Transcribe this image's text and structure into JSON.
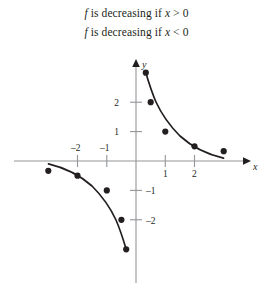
{
  "statements": [
    {
      "id": "statement-1",
      "text": "f is decreasing if x > 0"
    },
    {
      "id": "statement-2",
      "text": "f is decreasing if x < 0"
    }
  ],
  "colors": {
    "ink": "#231f20",
    "axis": "#939598",
    "background": "#ffffff"
  },
  "chart_data": {
    "type": "line",
    "title": "",
    "xlabel": "x",
    "ylabel": "y",
    "xlim": [
      -3.6,
      3.6
    ],
    "ylim": [
      -3.6,
      3.6
    ],
    "grid": false,
    "legend": "none",
    "function": "y = 1/x",
    "x_ticks": [
      -2,
      -1,
      1,
      2
    ],
    "x_tick_labels": [
      "–2",
      "–1",
      "1",
      "2"
    ],
    "y_ticks": [
      2,
      1,
      -1,
      -2
    ],
    "y_tick_labels": [
      "2",
      "1",
      "–1",
      "–2"
    ],
    "series": [
      {
        "name": "branch-positive-x",
        "points": [
          {
            "x": 0.33,
            "y": 3.0
          },
          {
            "x": 0.5,
            "y": 2.0
          },
          {
            "x": 1.0,
            "y": 1.0
          },
          {
            "x": 2.0,
            "y": 0.5
          },
          {
            "x": 3.0,
            "y": 0.33
          }
        ]
      },
      {
        "name": "branch-negative-x",
        "points": [
          {
            "x": -3.0,
            "y": -0.33
          },
          {
            "x": -2.0,
            "y": -0.5
          },
          {
            "x": -1.0,
            "y": -1.0
          },
          {
            "x": -0.5,
            "y": -2.0
          },
          {
            "x": -0.33,
            "y": -3.0
          }
        ]
      }
    ]
  },
  "axis": {
    "x_arrow_label": "x",
    "y_arrow_label": "y"
  }
}
